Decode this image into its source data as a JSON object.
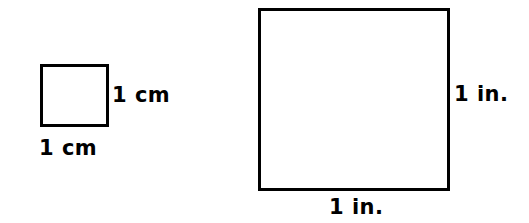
{
  "figure": {
    "background_color": "#ffffff",
    "stroke_color": "#000000",
    "text_color": "#000000",
    "shapes": [
      {
        "name": "centimeter-square",
        "type": "square",
        "side_value": 1,
        "unit": "cm",
        "width_label": "1 cm",
        "height_label": "1 cm",
        "stroke_width_px": 3,
        "fill": "#ffffff"
      },
      {
        "name": "inch-square",
        "type": "square",
        "side_value": 1,
        "unit": "in.",
        "width_label": "1 in.",
        "height_label": "1 in.",
        "stroke_width_px": 3,
        "fill": "#ffffff"
      }
    ]
  },
  "labels": {
    "cm_right": "1 cm",
    "cm_bottom": "1 cm",
    "in_right": "1 in.",
    "in_bottom": "1 in."
  }
}
